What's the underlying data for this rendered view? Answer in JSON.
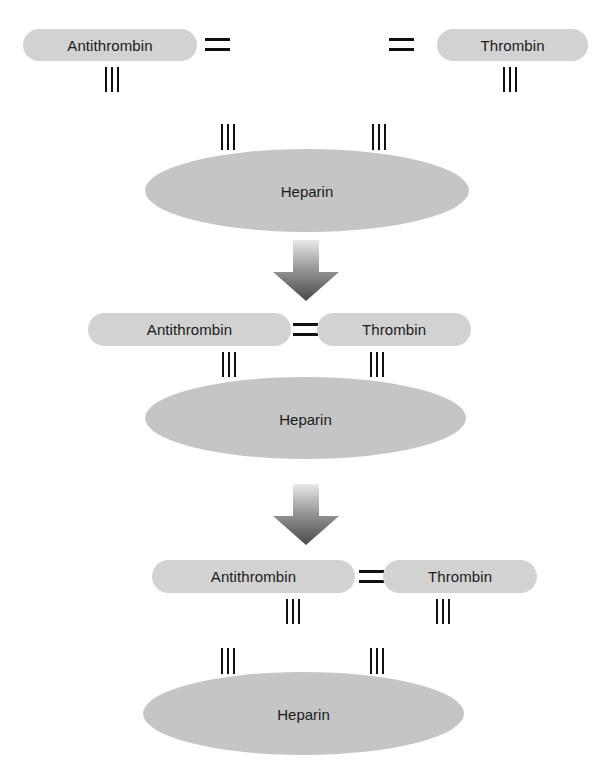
{
  "diagram": {
    "background_color": "#ffffff",
    "pill_color": "#d2d2d2",
    "ellipse_color": "#c5c5c5",
    "tick_color": "#101010",
    "arrow_gradient": [
      "#e8e8e8",
      "#4d4d4d"
    ],
    "labels": {
      "antithrombin": "Antithrombin",
      "thrombin": "Thrombin",
      "heparin": "Heparin",
      "bond": "=",
      "ticks": "III"
    },
    "stages": [
      {
        "id": "stage-1",
        "name": "separate-components",
        "antithrombin": "Antithrombin",
        "thrombin": "Thrombin",
        "heparin": "Heparin",
        "antithrombin_bond": "=",
        "thrombin_bond": "=",
        "antithrombin_ticks": "III",
        "thrombin_ticks": "III",
        "heparin_left_ticks": "III",
        "heparin_right_ticks": "III"
      },
      {
        "id": "stage-2",
        "name": "ternary-complex-on-heparin",
        "antithrombin": "Antithrombin",
        "thrombin": "Thrombin",
        "heparin": "Heparin",
        "bond": "=",
        "antithrombin_ticks": "III",
        "thrombin_ticks": "III",
        "heparin_left_ticks": "III",
        "heparin_right_ticks": "III"
      },
      {
        "id": "stage-3",
        "name": "complex-released-from-heparin",
        "antithrombin": "Antithrombin",
        "thrombin": "Thrombin",
        "heparin": "Heparin",
        "bond": "=",
        "antithrombin_ticks": "III",
        "thrombin_ticks": "III",
        "heparin_left_ticks": "III",
        "heparin_right_ticks": "III"
      }
    ],
    "arrows": [
      {
        "id": "arrow-1",
        "direction": "down"
      },
      {
        "id": "arrow-2",
        "direction": "down"
      }
    ]
  }
}
